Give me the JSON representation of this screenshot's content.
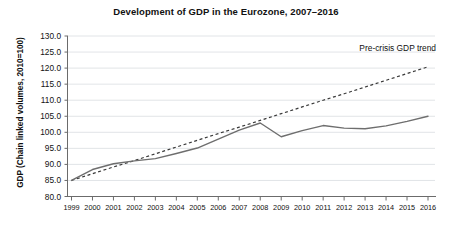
{
  "chart_data": {
    "type": "line",
    "title": "Development of GDP in the Eurozone, 2007–2016",
    "xlabel": "",
    "ylabel": "GDP (Chain linked volumes, 2010=100)",
    "x": [
      1999,
      2000,
      2001,
      2002,
      2003,
      2004,
      2005,
      2006,
      2007,
      2008,
      2009,
      2010,
      2011,
      2012,
      2013,
      2014,
      2015,
      2016
    ],
    "categories": [
      "1999",
      "2000",
      "2001",
      "2002",
      "2003",
      "2004",
      "2005",
      "2006",
      "2007",
      "2008",
      "2009",
      "2010",
      "2011",
      "2012",
      "2013",
      "2014",
      "2015",
      "2016"
    ],
    "xlim": [
      1999,
      2016
    ],
    "ylim": [
      80.0,
      130.0
    ],
    "ytick_labels": [
      "130.0",
      "125.0",
      "120.0",
      "115.0",
      "110.0",
      "105.0",
      "100.0",
      "95.0",
      "90.0",
      "85.0",
      "80.0"
    ],
    "ytick_values": [
      130.0,
      125.0,
      120.0,
      115.0,
      110.0,
      105.0,
      100.0,
      95.0,
      90.0,
      85.0,
      80.0
    ],
    "grid": true,
    "legend": false,
    "series": [
      {
        "name": "Actual GDP",
        "style": "solid",
        "color": "#6e6e6e",
        "values": [
          85.0,
          88.4,
          90.2,
          91.1,
          91.8,
          93.4,
          95.1,
          97.9,
          100.7,
          102.9,
          98.6,
          100.5,
          102.1,
          101.3,
          101.1,
          102.0,
          103.4,
          105.0
        ]
      },
      {
        "name": "Pre-crisis GDP trend",
        "style": "dashed",
        "color": "#3a3a3a",
        "values": [
          85.0,
          87.1,
          89.2,
          91.2,
          93.3,
          95.4,
          97.5,
          99.6,
          101.6,
          103.7,
          105.8,
          107.9,
          110.0,
          112.0,
          114.1,
          116.2,
          118.3,
          120.4
        ]
      }
    ],
    "annotations": [
      {
        "text": "Pre-crisis GDP trend",
        "target_series": "Pre-crisis GDP trend"
      }
    ]
  }
}
